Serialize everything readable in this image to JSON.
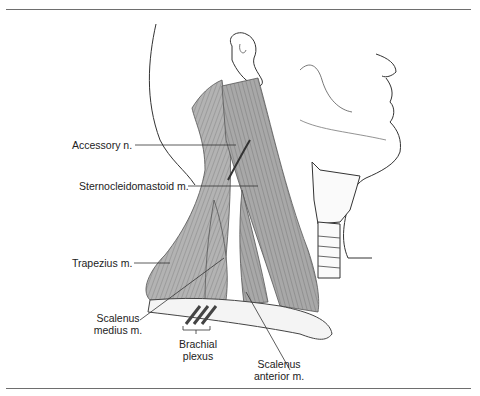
{
  "figure": {
    "labels": {
      "accessory_nerve": "Accessory n.",
      "sternocleidomastoid": "Sternocleidomastoid m.",
      "trapezius": "Trapezius m.",
      "scalenus_medius_line1": "Scalenus",
      "scalenus_medius_line2": "medius m.",
      "brachial_plexus_line1": "Brachial",
      "brachial_plexus_line2": "plexus",
      "scalenus_anterior_line1": "Scalenus",
      "scalenus_anterior_line2": "anterior m."
    },
    "colors": {
      "muscle_fill": "#a9a9a9",
      "muscle_stroke": "#555555",
      "line": "#333333",
      "rule": "#6e6e6e"
    }
  }
}
